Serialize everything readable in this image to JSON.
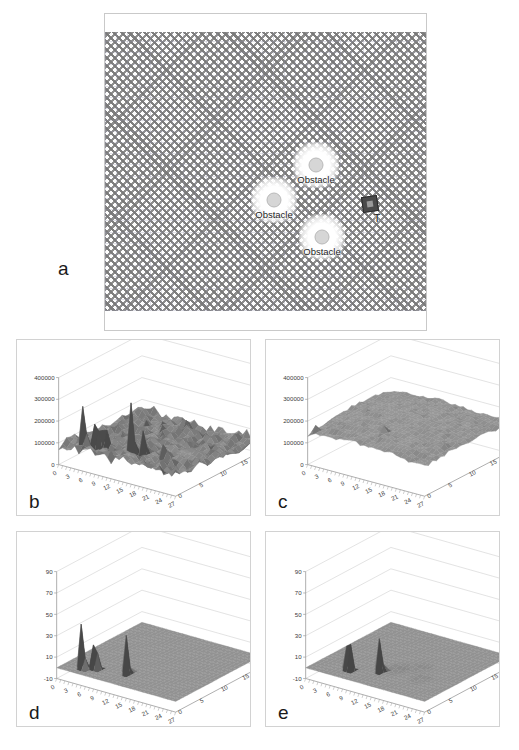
{
  "figure": {
    "panels": [
      {
        "letter": "a",
        "kind": "map"
      },
      {
        "letter": "b",
        "kind": "surface3d"
      },
      {
        "letter": "c",
        "kind": "surface3d"
      },
      {
        "letter": "d",
        "kind": "surface3d"
      },
      {
        "letter": "e",
        "kind": "surface3d"
      }
    ]
  },
  "panel_a": {
    "letter": "a",
    "obstacles": [
      {
        "label": "Obstacle",
        "x": 211,
        "y": 133
      },
      {
        "label": "Obstacle",
        "x": 169,
        "y": 168
      },
      {
        "label": "Obstacle",
        "x": 217,
        "y": 205
      }
    ],
    "target": {
      "label": "T",
      "x": 265,
      "y": 172,
      "icon": "target-square-icon"
    }
  },
  "chart_data": [
    {
      "panel": "b",
      "type": "surface",
      "title": "",
      "xlabel": "",
      "ylabel": "",
      "zlabel": "",
      "x_ticks": [
        0,
        3,
        6,
        9,
        12,
        15,
        18,
        21,
        24,
        27
      ],
      "y_ticks": [
        0,
        5,
        10,
        15,
        20
      ],
      "z_ticks": [
        0,
        100000,
        200000,
        300000,
        400000
      ],
      "zlim": [
        0,
        400000
      ],
      "xlim": [
        0,
        27
      ],
      "ylim": [
        0,
        20
      ],
      "grid": true,
      "description": "Rough noisy surface with dense medium relief and several tall narrow spikes near the front-left and mid region; peaks reach about 400000.",
      "peaks": [
        {
          "x": 4,
          "y": 2,
          "z": 390000
        },
        {
          "x": 6,
          "y": 3,
          "z": 330000
        },
        {
          "x": 7,
          "y": 4,
          "z": 300000
        },
        {
          "x": 13,
          "y": 4,
          "z": 400000
        },
        {
          "x": 15,
          "y": 5,
          "z": 250000
        },
        {
          "x": 19,
          "y": 6,
          "z": 230000
        }
      ],
      "base_level": 60000
    },
    {
      "panel": "c",
      "type": "surface",
      "title": "",
      "xlabel": "",
      "ylabel": "",
      "zlabel": "",
      "x_ticks": [
        0,
        3,
        6,
        9,
        12,
        15,
        18,
        21,
        24,
        27
      ],
      "y_ticks": [
        0,
        5,
        10,
        15,
        20
      ],
      "z_ticks": [
        0,
        100000,
        200000,
        300000,
        400000
      ],
      "zlim": [
        0,
        400000
      ],
      "xlim": [
        0,
        27
      ],
      "ylim": [
        0,
        20
      ],
      "grid": true,
      "description": "Lower, gently undulating surface around 120000-200000 with three isolated narrow spikes reaching roughly 200000-230000.",
      "peaks": [
        {
          "x": 1,
          "y": 1,
          "z": 180000
        },
        {
          "x": 13,
          "y": 5,
          "z": 230000
        },
        {
          "x": 19,
          "y": 6,
          "z": 190000
        }
      ],
      "base_level": 140000
    },
    {
      "panel": "d",
      "type": "surface",
      "title": "",
      "xlabel": "",
      "ylabel": "",
      "zlabel": "",
      "x_ticks": [
        0,
        3,
        6,
        9,
        12,
        15,
        18,
        21,
        24,
        27
      ],
      "y_ticks": [
        0,
        5,
        10,
        15,
        20
      ],
      "z_ticks": [
        -10,
        10,
        30,
        50,
        70,
        90
      ],
      "zlim": [
        -10,
        90
      ],
      "xlim": [
        0,
        27
      ],
      "ylim": [
        0,
        20
      ],
      "grid": true,
      "description": "Flat zero-level plane with three sharp isolated spikes near the left-front; heights about 75, 60 and 55.",
      "peaks": [
        {
          "x": 4,
          "y": 2,
          "z": 75
        },
        {
          "x": 6,
          "y": 3,
          "z": 60
        },
        {
          "x": 12,
          "y": 4,
          "z": 55
        }
      ],
      "base_level": 0
    },
    {
      "panel": "e",
      "type": "surface",
      "title": "",
      "xlabel": "",
      "ylabel": "",
      "zlabel": "",
      "x_ticks": [
        0,
        3,
        6,
        9,
        12,
        15,
        18,
        21,
        24,
        27
      ],
      "y_ticks": [
        0,
        5,
        10,
        15,
        20
      ],
      "z_ticks": [
        -10,
        10,
        30,
        50,
        70,
        90
      ],
      "zlim": [
        -10,
        90
      ],
      "xlim": [
        0,
        27
      ],
      "ylim": [
        0,
        20
      ],
      "grid": true,
      "description": "Flat zero-level plane with two sharp spikes (about 75 and 52) plus a few faint shallow dimples in the mid field.",
      "peaks": [
        {
          "x": 7,
          "y": 3,
          "z": 75
        },
        {
          "x": 12,
          "y": 5,
          "z": 52
        }
      ],
      "base_level": 0
    }
  ],
  "colors": {
    "surface_fill": "#808080",
    "surface_dark": "#4a4a4a",
    "panel_border": "#d2d2d2",
    "grid_line": "#c8c8c8",
    "text": "#1a1a1a"
  }
}
